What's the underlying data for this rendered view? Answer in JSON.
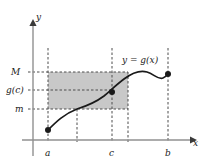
{
  "figure": {
    "type": "math-graph",
    "background_color": "#ffffff",
    "curve_color": "#1a1a1a",
    "axis_color": "#808080",
    "dashed_color": "#4d4d4d",
    "shade_color": "#c8c8c8",
    "point_color": "#1a1a1a"
  },
  "axes": {
    "y_axis_label": "y",
    "x_axis_label": "x",
    "origin_px": {
      "x": 33,
      "y": 140
    }
  },
  "y_ticks": [
    {
      "label": "M",
      "y_px": 72
    },
    {
      "label": "g(c)",
      "y_px": 90
    },
    {
      "label": "m",
      "y_px": 109
    }
  ],
  "x_ticks": [
    {
      "label": "a",
      "x_px": 48
    },
    {
      "label": "c",
      "x_px": 112
    },
    {
      "label": "b",
      "x_px": 168
    }
  ],
  "curve": {
    "label": "y = g(x)",
    "path": "M 48,130 C 56,122 64,114 77,109 C 90,105 96,102 104,96 C 110,91 116,85 124,79 C 132,73 140,70 147,72 C 154,74 158,80 163,78 C 166,77 167,75 168,74",
    "label_position_px": {
      "x": 122,
      "y": 56
    }
  },
  "points": [
    {
      "name": "left-endpoint",
      "x_px": 48,
      "y_px": 130,
      "label": "(a, g(a))"
    },
    {
      "name": "c-point",
      "x_px": 112,
      "y_px": 92,
      "label": "(c, g(c))"
    },
    {
      "name": "right-endpoint",
      "x_px": 168,
      "y_px": 74,
      "label": "(b, g(b))"
    }
  ],
  "shaded_rect": {
    "x_px": 48,
    "y_px": 72,
    "width_px": 80,
    "height_px": 37,
    "fill": "#c8c8c8"
  },
  "vertical_dashed_lines": [
    {
      "name": "line-a",
      "x_px": 48,
      "y_top_px": 48,
      "y_bottom_px": 140
    },
    {
      "name": "line-mid",
      "x_px": 77,
      "y_top_px": 109,
      "y_bottom_px": 140
    },
    {
      "name": "line-c",
      "x_px": 112,
      "y_top_px": 48,
      "y_bottom_px": 140
    },
    {
      "name": "line-rect-right",
      "x_px": 128,
      "y_top_px": 72,
      "y_bottom_px": 140
    },
    {
      "name": "line-b",
      "x_px": 168,
      "y_top_px": 48,
      "y_bottom_px": 140
    }
  ],
  "horizontal_dashed_lines": [
    {
      "name": "line-M",
      "y_px": 72,
      "x_left_px": 28,
      "x_right_px": 128
    },
    {
      "name": "line-gc",
      "y_px": 90,
      "x_left_px": 28,
      "x_right_px": 112
    },
    {
      "name": "line-m",
      "y_px": 109,
      "x_left_px": 28,
      "x_right_px": 128
    }
  ]
}
